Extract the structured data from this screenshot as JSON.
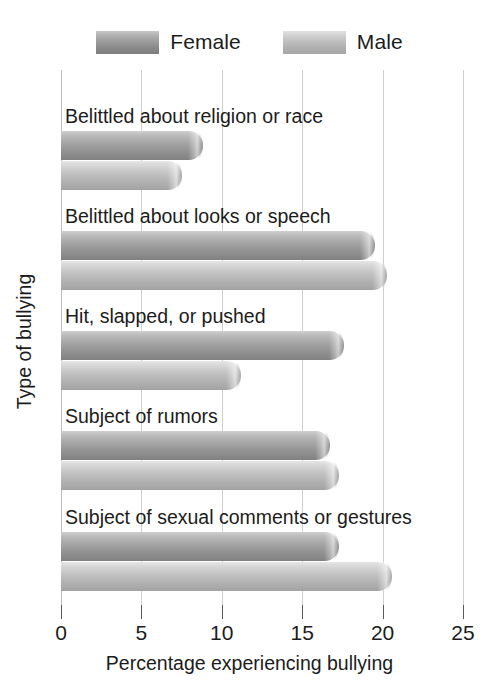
{
  "chart_data": {
    "type": "bar",
    "orientation": "horizontal",
    "title": "",
    "xlabel": "Percentage experiencing bullying",
    "ylabel": "Type of bullying",
    "xlim": [
      0,
      25
    ],
    "xticks": [
      0,
      5,
      10,
      15,
      20,
      25
    ],
    "xtick_labels": [
      "0",
      "5",
      "10",
      "15",
      "20",
      "25"
    ],
    "grid": true,
    "legend_position": "top-center",
    "categories": [
      "Belittled about religion or race",
      "Belittled about looks or speech",
      "Hit, slapped, or pushed",
      "Subject of rumors",
      "Subject of sexual comments or gestures"
    ],
    "series": [
      {
        "name": "Female",
        "color": "#9a9a9a",
        "values": [
          8.8,
          19.5,
          17.6,
          16.7,
          17.3
        ]
      },
      {
        "name": "Male",
        "color": "#bdbdbd",
        "values": [
          7.5,
          20.3,
          11.2,
          17.3,
          20.6
        ]
      }
    ]
  },
  "legend": {
    "entries": [
      {
        "label": "Female",
        "swatch": "female-legend-swatch"
      },
      {
        "label": "Male",
        "swatch": "male-legend-swatch"
      }
    ]
  },
  "axes": {
    "x_title": "Percentage experiencing bullying",
    "y_title": "Type of bullying",
    "x_tick_labels": [
      "0",
      "5",
      "10",
      "15",
      "20",
      "25"
    ]
  },
  "colors": {
    "female_bar": "#9a9a9a",
    "male_bar": "#bdbdbd",
    "gridline": "#cfcfcf",
    "text": "#1c1c1c",
    "background": "#ffffff"
  }
}
